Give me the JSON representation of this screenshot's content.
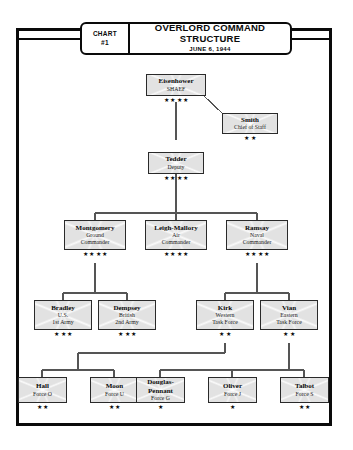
{
  "header": {
    "chart_label_line1": "CHART",
    "chart_label_line2": "#1",
    "title_line1": "OVERLORD COMMAND",
    "title_line2": "STRUCTURE",
    "date": "JUNE 6, 1944"
  },
  "nodes": {
    "eisenhower": {
      "name": "Eisenhower",
      "sub1": "SHAEF",
      "sub2": "",
      "stars": "★ ★ ★ ★"
    },
    "smith": {
      "name": "Smith",
      "sub1": "Chief of Staff",
      "sub2": "",
      "stars": "★ ★"
    },
    "tedder": {
      "name": "Tedder",
      "sub1": "Deputy",
      "sub2": "",
      "stars": "★ ★ ★ ★"
    },
    "montgomery": {
      "name": "Montgomery",
      "sub1": "Ground",
      "sub2": "Commander",
      "stars": "★ ★ ★ ★"
    },
    "leigh_mallory": {
      "name": "Leigh-Mallory",
      "sub1": "Air",
      "sub2": "Commander",
      "stars": "★ ★ ★ ★"
    },
    "ramsay": {
      "name": "Ramsay",
      "sub1": "Naval",
      "sub2": "Commander",
      "stars": "★ ★ ★ ★"
    },
    "bradley": {
      "name": "Bradley",
      "sub1": "U.S.",
      "sub2": "1st Army",
      "stars": "★ ★ ★"
    },
    "dempsey": {
      "name": "Dempsey",
      "sub1": "British",
      "sub2": "2nd Army",
      "stars": "★ ★ ★"
    },
    "kirk": {
      "name": "Kirk",
      "sub1": "Western",
      "sub2": "Task Force",
      "stars": "★ ★"
    },
    "vian": {
      "name": "Vian",
      "sub1": "Eastern",
      "sub2": "Task Force",
      "stars": "★ ★"
    },
    "hall": {
      "name": "Hall",
      "sub1": "Force O",
      "sub2": "",
      "stars": "★ ★"
    },
    "moon": {
      "name": "Moon",
      "sub1": "Force U",
      "sub2": "",
      "stars": "★ ★"
    },
    "douglas_pennant": {
      "name": "Douglas-\nPennant",
      "sub1": "Force G",
      "sub2": "",
      "stars": "★"
    },
    "oliver": {
      "name": "Oliver",
      "sub1": "Force J",
      "sub2": "",
      "stars": "★"
    },
    "talbot": {
      "name": "Talbot",
      "sub1": "Force S",
      "sub2": "",
      "stars": "★ ★"
    }
  },
  "colors": {
    "frame": "#0a0a0a",
    "box_fill": "#e2e2e2",
    "box_border": "#2a2a2a",
    "line": "#555555",
    "text": "#0a0a0a",
    "page": "#ffffff"
  }
}
